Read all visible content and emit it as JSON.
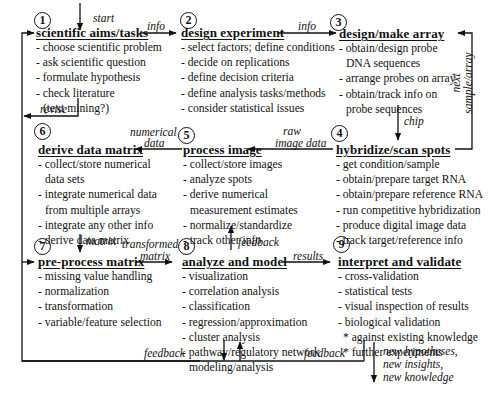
{
  "steps": [
    {
      "number": "1",
      "title": "scientific aims/tasks",
      "items": [
        "- choose scientific problem",
        "- ask scientific question",
        "- formulate hypothesis",
        "- check literature",
        "  (text mining?)"
      ]
    },
    {
      "number": "2",
      "title": "design experiment",
      "items": [
        "- select factors; define conditions",
        "- decide on replications",
        "- define decision criteria",
        "- define analysis tasks/methods",
        "- consider statistical issues"
      ]
    },
    {
      "number": "3",
      "title": "design/make array",
      "items": [
        "- obtain/design probe",
        "  DNA sequences",
        "- arrange probes on array",
        "- obtain/track info on",
        "  probe sequences"
      ]
    },
    {
      "number": "4",
      "title": "hybridize/scan spots",
      "items": [
        "- get condition/sample",
        "- obtain/prepare target RNA",
        "- obtain/prepare reference RNA",
        "- run competitive hybridization",
        "- produce digital  image data",
        "- track target/reference info"
      ]
    },
    {
      "number": "5",
      "title": "process image",
      "items": [
        "- collect/store images",
        "- analyze spots",
        "- derive numerical",
        "  measurement estimates",
        "- normalize/standardize",
        "- track other info"
      ]
    },
    {
      "number": "6",
      "title": "derive data matrix",
      "items": [
        "- collect/store numerical",
        "  data sets",
        "- integrate numerical data",
        "  from multiple arrays",
        "- integrate any other info",
        "- derive data matrix"
      ]
    },
    {
      "number": "7",
      "title": "pre-process matrix",
      "items": [
        "- missing value handling",
        "- normalization",
        "- transformation",
        "- variable/feature selection"
      ]
    },
    {
      "number": "8",
      "title": "analyze and model",
      "items": [
        "- visualization",
        "- correlation analysis",
        "- classification",
        "- regression/approximation",
        "- cluster analysis",
        "- pathway/regulatory network",
        "  modeling/analysis"
      ]
    },
    {
      "number": "9",
      "title": "interpret and validate",
      "items": [
        "- cross-validation",
        "- statistical tests",
        "- visual inspection of results",
        "- biological validation",
        "  * against existing knowledge",
        "  * further experiments"
      ]
    }
  ],
  "edge_labels": {
    "start": "start",
    "info_1_2": "info",
    "info_2_3": "info",
    "chip": "chip",
    "next_sample_array_1": "next",
    "next_sample_array_2": "sample/array",
    "raw_image_data_1": "raw",
    "raw_image_data_2": "image data",
    "numerical_data_1": "numerical",
    "numerical_data_2": "data",
    "revise": "revise",
    "matrix": "matrix",
    "transformed_matrix_1": "transformed",
    "transformed_matrix_2": "matrix",
    "feedback_up": "feedback",
    "results": "results",
    "feedback_bottom_left": "feedback",
    "feedback_bottom_right": "feedback",
    "outcome_1": "new hypotheses,",
    "outcome_2": "new insights,",
    "outcome_3": "new knowledge"
  }
}
